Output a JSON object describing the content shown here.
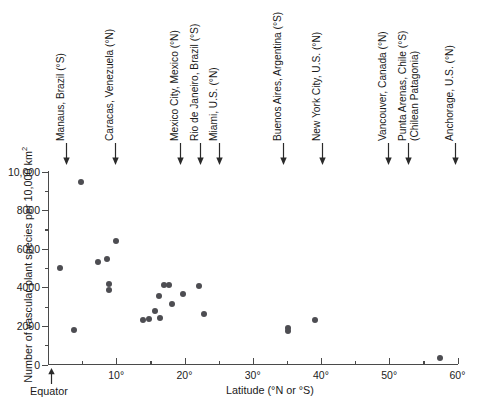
{
  "chart_data": {
    "type": "scatter",
    "title": "",
    "xlabel": "Latitude (°N or °S)",
    "ylabel": "Number of vascular plant species per 10,000 km²",
    "xlim": [
      0,
      60
    ],
    "ylim": [
      0,
      10000
    ],
    "grid": false,
    "legend": null,
    "point_color": "#4d4d52",
    "x_ticks": [
      {
        "value": 10,
        "label": "10°"
      },
      {
        "value": 20,
        "label": "20°"
      },
      {
        "value": 30,
        "label": "30°"
      },
      {
        "value": 40,
        "label": "40°"
      },
      {
        "value": 50,
        "label": "50°"
      },
      {
        "value": 60,
        "label": "60°"
      }
    ],
    "x_minor_ticks": [
      5,
      15,
      25,
      35,
      45,
      55
    ],
    "y_ticks": [
      {
        "value": 0,
        "label": "0"
      },
      {
        "value": 2000,
        "label": "2000"
      },
      {
        "value": 4000,
        "label": "4000"
      },
      {
        "value": 6000,
        "label": "6000"
      },
      {
        "value": 8000,
        "label": "8000"
      },
      {
        "value": 10000,
        "label": "10,000"
      }
    ],
    "y_minor_ticks": [
      1000,
      3000,
      5000,
      7000,
      9000
    ],
    "origin_annotation": "Equator",
    "points": [
      {
        "x": 4.8,
        "y": 9470
      },
      {
        "x": 1.8,
        "y": 5020
      },
      {
        "x": 3.8,
        "y": 1810
      },
      {
        "x": 7.3,
        "y": 5330
      },
      {
        "x": 10.0,
        "y": 6410
      },
      {
        "x": 8.6,
        "y": 5480
      },
      {
        "x": 8.9,
        "y": 4190
      },
      {
        "x": 9.0,
        "y": 3880
      },
      {
        "x": 13.9,
        "y": 2280
      },
      {
        "x": 14.8,
        "y": 2380
      },
      {
        "x": 15.7,
        "y": 2790
      },
      {
        "x": 16.2,
        "y": 3540
      },
      {
        "x": 17.0,
        "y": 4140
      },
      {
        "x": 17.7,
        "y": 4140
      },
      {
        "x": 16.4,
        "y": 2430
      },
      {
        "x": 18.2,
        "y": 3160
      },
      {
        "x": 19.8,
        "y": 3630
      },
      {
        "x": 22.1,
        "y": 4090
      },
      {
        "x": 22.9,
        "y": 2640
      },
      {
        "x": 35.2,
        "y": 1910
      },
      {
        "x": 35.2,
        "y": 1710
      },
      {
        "x": 39.1,
        "y": 2330
      },
      {
        "x": 57.5,
        "y": 360
      }
    ],
    "city_annotations": [
      {
        "x_px": 66,
        "lines": [
          "Manaus, Brazil (°S)"
        ]
      },
      {
        "x_px": 115,
        "lines": [
          "Caracas, Venezuela (°N)"
        ]
      },
      {
        "x_px": 180,
        "lines": [
          "Mexico City, Mexico (°N)"
        ]
      },
      {
        "x_px": 200,
        "lines": [
          "Rio de Janeiro, Brazil (°S)"
        ]
      },
      {
        "x_px": 219,
        "lines": [
          "Miami, U.S. (°N)"
        ]
      },
      {
        "x_px": 283,
        "lines": [
          "Buenos Aires, Argentina (°S)"
        ]
      },
      {
        "x_px": 322,
        "lines": [
          "New York City, U.S. (°N)"
        ]
      },
      {
        "x_px": 388,
        "lines": [
          "Vancouver, Canada (°N)"
        ]
      },
      {
        "x_px": 408,
        "lines": [
          "Punta Arenas, Chile (°S)",
          "(Chilean Patagonia)"
        ]
      },
      {
        "x_px": 455,
        "lines": [
          "Anchorage, U.S. (°N)"
        ]
      }
    ]
  }
}
